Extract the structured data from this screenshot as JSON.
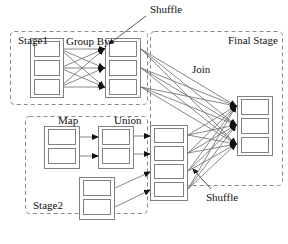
{
  "figure": {
    "type": "diagram",
    "subtype": "dataflow-stage-graph",
    "background_color": "#ffffff",
    "line_color": "#6b6b6b",
    "box_stroke_color": "#808080",
    "box_fill_color": "#ffffff",
    "dashed_stroke_color": "#8a8a8a",
    "arrowhead_color": "#111111",
    "text_color": "#111111"
  },
  "labels": {
    "stage1": "Stage1",
    "stage2": "Stage2",
    "final_stage": "Final Stage",
    "group_by": "Group By",
    "map": "Map",
    "union": "Union",
    "join": "Join",
    "shuffle_top": "Shuffle",
    "shuffle_bottom": "Shuffle"
  },
  "stages": [
    {
      "name": "stage1",
      "label": "Stage1",
      "dashed_region": {
        "x": 10,
        "y": 31,
        "w": 138,
        "h": 74
      },
      "label_pos": {
        "x": 18,
        "y": 44
      },
      "groups": [
        {
          "name": "stage1-input-group",
          "outer": {
            "x": 30,
            "y": 38,
            "w": 34,
            "h": 60
          },
          "tasks": [
            {
              "name": "stage1-input-task-1",
              "x": 34,
              "y": 41,
              "w": 26,
              "h": 16
            },
            {
              "name": "stage1-input-task-2",
              "x": 34,
              "y": 60,
              "w": 26,
              "h": 16
            },
            {
              "name": "stage1-input-task-3",
              "x": 34,
              "y": 79,
              "w": 26,
              "h": 16
            }
          ]
        },
        {
          "name": "stage1-groupby-group",
          "outer": {
            "x": 105,
            "y": 38,
            "w": 36,
            "h": 60
          },
          "tasks": [
            {
              "name": "stage1-groupby-task-1",
              "x": 109,
              "y": 41,
              "w": 28,
              "h": 16
            },
            {
              "name": "stage1-groupby-task-2",
              "x": 109,
              "y": 60,
              "w": 28,
              "h": 16
            },
            {
              "name": "stage1-groupby-task-3",
              "x": 109,
              "y": 79,
              "w": 28,
              "h": 16
            }
          ]
        }
      ],
      "operator_label": {
        "text": "Group By",
        "x": 66,
        "y": 45
      }
    },
    {
      "name": "stage2",
      "label": "Stage2",
      "dashed_region": {
        "x": 25,
        "y": 116,
        "w": 123,
        "h": 98
      },
      "label_pos": {
        "x": 33,
        "y": 208
      },
      "groups": [
        {
          "name": "stage2-input-group",
          "outer": {
            "x": 44,
            "y": 126,
            "w": 36,
            "h": 43
          },
          "tasks": [
            {
              "name": "stage2-input-task-1",
              "x": 48,
              "y": 129,
              "w": 28,
              "h": 16
            },
            {
              "name": "stage2-input-task-2",
              "x": 48,
              "y": 148,
              "w": 28,
              "h": 16
            }
          ]
        },
        {
          "name": "stage2-map-group",
          "outer": {
            "x": 98,
            "y": 126,
            "w": 36,
            "h": 43
          },
          "tasks": [
            {
              "name": "stage2-map-task-1",
              "x": 102,
              "y": 129,
              "w": 28,
              "h": 16
            },
            {
              "name": "stage2-map-task-2",
              "x": 102,
              "y": 148,
              "w": 28,
              "h": 16
            }
          ]
        },
        {
          "name": "stage2-extra-group",
          "outer": {
            "x": 79,
            "y": 177,
            "w": 36,
            "h": 43
          },
          "tasks": [
            {
              "name": "stage2-extra-task-1",
              "x": 83,
              "y": 180,
              "w": 28,
              "h": 16
            },
            {
              "name": "stage2-extra-task-2",
              "x": 83,
              "y": 199,
              "w": 28,
              "h": 16
            }
          ]
        }
      ],
      "operator_label": {
        "text": "Map",
        "x": 104,
        "y": 124
      }
    },
    {
      "name": "final-stage",
      "label": "Final Stage",
      "dashed_region": {
        "x": 150,
        "y": 31,
        "w": 134,
        "h": 155
      },
      "label_pos": {
        "x": 228,
        "y": 44
      },
      "groups": [
        {
          "name": "union-group",
          "outer": {
            "x": 150,
            "y": 125,
            "w": 38,
            "h": 76
          },
          "tasks": [
            {
              "name": "union-task-1",
              "x": 154,
              "y": 128,
              "w": 30,
              "h": 15
            },
            {
              "name": "union-task-2",
              "x": 154,
              "y": 146,
              "w": 30,
              "h": 15
            },
            {
              "name": "union-task-3",
              "x": 154,
              "y": 164,
              "w": 30,
              "h": 15
            },
            {
              "name": "union-task-4",
              "x": 154,
              "y": 182,
              "w": 30,
              "h": 15
            }
          ]
        },
        {
          "name": "final-result-group",
          "outer": {
            "x": 237,
            "y": 96,
            "w": 36,
            "h": 60
          },
          "tasks": [
            {
              "name": "final-result-task-1",
              "x": 241,
              "y": 99,
              "w": 28,
              "h": 16
            },
            {
              "name": "final-result-task-2",
              "x": 241,
              "y": 118,
              "w": 28,
              "h": 16
            },
            {
              "name": "final-result-task-3",
              "x": 241,
              "y": 137,
              "w": 28,
              "h": 16
            }
          ]
        }
      ],
      "operator_label": {
        "text": "Union",
        "x": 153,
        "y": 124
      }
    }
  ],
  "annotations": [
    {
      "name": "shuffle-annotation-top",
      "text": "Shuffle",
      "text_x": 150,
      "text_y": 12,
      "leader_from": {
        "x": 146,
        "y": 16
      },
      "leader_to": {
        "x": 108,
        "y": 45
      }
    },
    {
      "name": "shuffle-annotation-bottom",
      "text": "Shuffle",
      "text_x": 208,
      "text_y": 197,
      "leader_from": {
        "x": 210,
        "y": 188
      },
      "leader_to": {
        "x": 192,
        "y": 168
      }
    },
    {
      "name": "join-annotation",
      "text": "Join",
      "text_x": 192,
      "text_y": 72
    }
  ],
  "edges": {
    "stage1_shuffle": {
      "name": "stage1-groupby-shuffle-edges",
      "description": "all-to-all from Stage1 input tasks to Group By tasks",
      "count": 9
    },
    "stage2_map": {
      "name": "stage2-map-edges",
      "description": "one-to-one from Stage2 input tasks to Map tasks",
      "count": 2
    },
    "map_union": {
      "name": "map-to-union-edges",
      "description": "one-to-one from Map tasks to top Union tasks",
      "count": 2
    },
    "extra_union": {
      "name": "extra-to-union-edges",
      "description": "one-to-one from extra Stage2 tasks to bottom Union tasks",
      "count": 2
    },
    "join_edges": {
      "name": "join-edges",
      "description": "all-to-all from Group By tasks to Final Stage result tasks",
      "count": 9
    },
    "final_shuffle": {
      "name": "final-shuffle-edges",
      "description": "all-to-all from Union tasks to Final Stage result tasks",
      "count": 12
    }
  }
}
